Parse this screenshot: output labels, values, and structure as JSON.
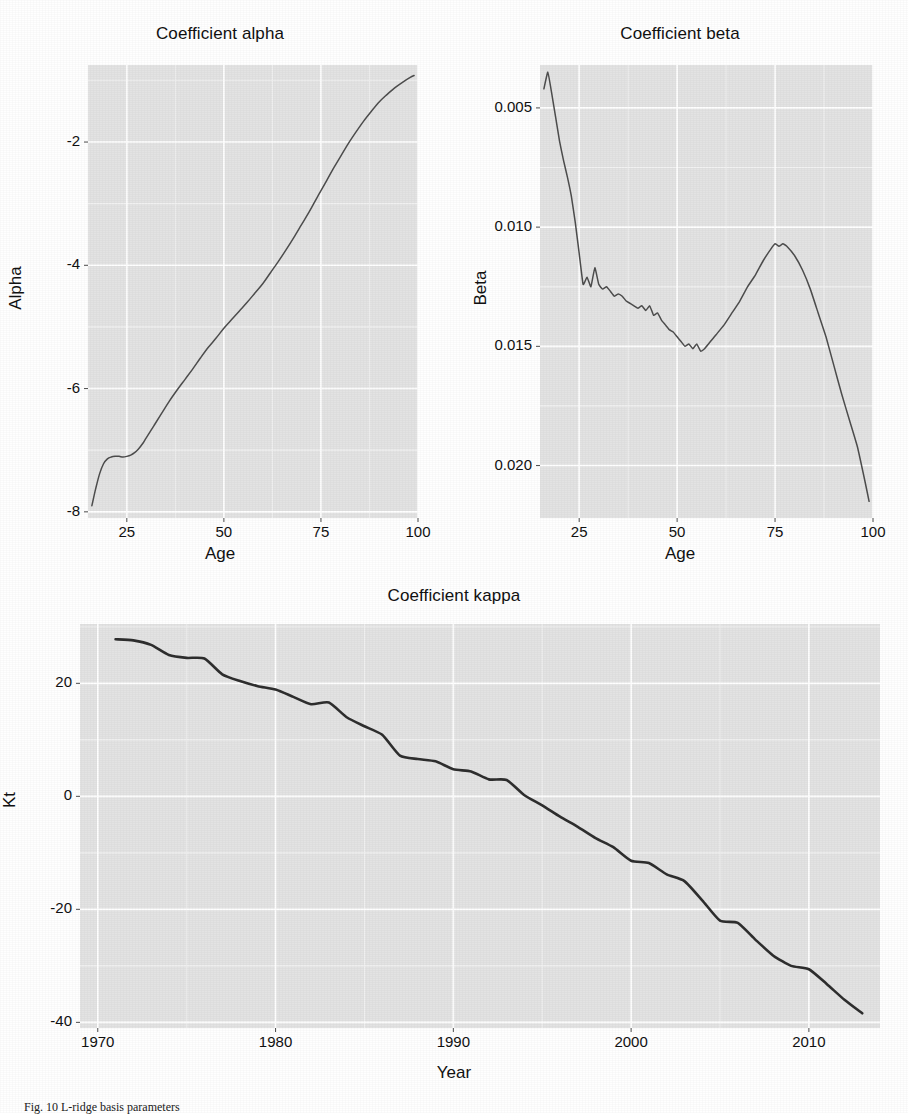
{
  "figure": {
    "caption": "Fig. 10  L-ridge basis parameters",
    "background": "#ffffff",
    "panel_fill": "#e3e3e3",
    "grid_color": "#ffffff",
    "line_color": "#4d4d4d"
  },
  "chart_data": [
    {
      "id": "alpha",
      "type": "line",
      "title": "Coefficient alpha",
      "xlabel": "Age",
      "ylabel": "Alpha",
      "xlim": [
        15,
        100
      ],
      "ylim": [
        -8.1,
        -0.75
      ],
      "xticks": [
        25,
        50,
        75,
        100
      ],
      "yticks": [
        -2,
        -4,
        -6,
        -8
      ],
      "xtick_labels": [
        "25",
        "50",
        "75",
        "100"
      ],
      "ytick_labels": [
        "-2",
        "-4",
        "-6",
        "-8"
      ],
      "grid": true,
      "legend": "none",
      "x": [
        16,
        17,
        18,
        19,
        20,
        21,
        22,
        23,
        24,
        25,
        26,
        27,
        28,
        29,
        30,
        32,
        34,
        36,
        38,
        40,
        42,
        44,
        46,
        48,
        50,
        52,
        54,
        56,
        58,
        60,
        62,
        64,
        66,
        68,
        70,
        72,
        74,
        76,
        78,
        80,
        82,
        84,
        86,
        88,
        90,
        92,
        94,
        96,
        98,
        99
      ],
      "y": [
        -7.9,
        -7.62,
        -7.38,
        -7.22,
        -7.14,
        -7.11,
        -7.1,
        -7.1,
        -7.11,
        -7.1,
        -7.08,
        -7.04,
        -6.98,
        -6.9,
        -6.8,
        -6.6,
        -6.4,
        -6.2,
        -6.02,
        -5.85,
        -5.68,
        -5.5,
        -5.33,
        -5.18,
        -5.02,
        -4.88,
        -4.74,
        -4.6,
        -4.45,
        -4.3,
        -4.12,
        -3.94,
        -3.75,
        -3.55,
        -3.34,
        -3.13,
        -2.9,
        -2.68,
        -2.45,
        -2.24,
        -2.03,
        -1.84,
        -1.66,
        -1.5,
        -1.35,
        -1.23,
        -1.12,
        -1.03,
        -0.95,
        -0.92
      ]
    },
    {
      "id": "beta",
      "type": "line",
      "title": "Coefficient beta",
      "xlabel": "Age",
      "ylabel": "Beta",
      "xlim": [
        15,
        100
      ],
      "ylim": [
        0.0028,
        0.0218
      ],
      "xticks": [
        25,
        50,
        75,
        100
      ],
      "yticks": [
        0.005,
        0.01,
        0.015,
        0.02
      ],
      "xtick_labels": [
        "0.005",
        "0.010",
        "0.015",
        "0.020"
      ],
      "ytick_labels": [
        "0.020",
        "0.015",
        "0.010",
        "0.005"
      ],
      "grid": true,
      "legend": "none",
      "x": [
        16,
        17,
        18,
        19,
        20,
        21,
        22,
        23,
        24,
        25,
        26,
        27,
        28,
        29,
        30,
        31,
        32,
        33,
        34,
        35,
        36,
        37,
        38,
        39,
        40,
        41,
        42,
        43,
        44,
        45,
        46,
        47,
        48,
        49,
        50,
        51,
        52,
        53,
        54,
        55,
        56,
        57,
        58,
        59,
        60,
        62,
        64,
        66,
        68,
        70,
        72,
        74,
        75,
        76,
        77,
        78,
        80,
        82,
        84,
        86,
        88,
        90,
        92,
        94,
        96,
        98,
        99
      ],
      "y": [
        0.0208,
        0.0215,
        0.0206,
        0.0196,
        0.0186,
        0.0178,
        0.0171,
        0.0163,
        0.0152,
        0.0139,
        0.0126,
        0.0129,
        0.0125,
        0.0133,
        0.0126,
        0.0124,
        0.0125,
        0.0123,
        0.0121,
        0.0122,
        0.0121,
        0.0119,
        0.0118,
        0.0117,
        0.0116,
        0.0117,
        0.0115,
        0.0117,
        0.0113,
        0.0114,
        0.0111,
        0.0109,
        0.0107,
        0.0106,
        0.0104,
        0.0102,
        0.01,
        0.0101,
        0.0099,
        0.0101,
        0.0098,
        0.0099,
        0.0101,
        0.0103,
        0.0105,
        0.0109,
        0.0114,
        0.0119,
        0.0125,
        0.013,
        0.0136,
        0.0141,
        0.0143,
        0.0142,
        0.0143,
        0.0142,
        0.0138,
        0.0132,
        0.0124,
        0.0114,
        0.0104,
        0.0092,
        0.008,
        0.0069,
        0.0058,
        0.0043,
        0.0035
      ]
    },
    {
      "id": "kappa",
      "type": "line",
      "title": "Coefficient kappa",
      "xlabel": "Year",
      "ylabel": "Kt",
      "xlim": [
        1969,
        2014
      ],
      "ylim": [
        -41,
        30.5
      ],
      "xticks": [
        1970,
        1980,
        1990,
        2000,
        2010
      ],
      "yticks": [
        20,
        0,
        -20,
        -40
      ],
      "xtick_labels": [
        "1970",
        "1980",
        "1990",
        "2000",
        "2010"
      ],
      "ytick_labels": [
        "20",
        "0",
        "-20",
        "-40"
      ],
      "grid": true,
      "legend": "none",
      "x": [
        1971,
        1972,
        1973,
        1974,
        1975,
        1976,
        1977,
        1978,
        1979,
        1980,
        1981,
        1982,
        1983,
        1984,
        1985,
        1986,
        1987,
        1988,
        1989,
        1990,
        1991,
        1992,
        1993,
        1994,
        1995,
        1996,
        1997,
        1998,
        1999,
        2000,
        2001,
        2002,
        2003,
        2004,
        2005,
        2006,
        2007,
        2008,
        2009,
        2010,
        2011,
        2012,
        2013
      ],
      "y": [
        27.8,
        27.6,
        26.8,
        25.0,
        24.5,
        24.4,
        21.6,
        20.4,
        19.5,
        18.9,
        17.6,
        16.3,
        16.6,
        14.0,
        12.4,
        10.9,
        7.2,
        6.6,
        6.2,
        4.8,
        4.4,
        3.0,
        2.9,
        0.2,
        -1.6,
        -3.6,
        -5.4,
        -7.4,
        -9.0,
        -11.4,
        -11.8,
        -13.8,
        -15.0,
        -18.4,
        -22.0,
        -22.4,
        -25.4,
        -28.2,
        -30.0,
        -30.6,
        -33.2,
        -36.0,
        -38.4
      ]
    }
  ]
}
